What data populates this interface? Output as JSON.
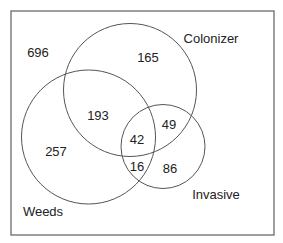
{
  "diagram": {
    "type": "venn",
    "sets": [
      {
        "id": "colonizer",
        "label": "Colonizer"
      },
      {
        "id": "weeds",
        "label": "Weeds"
      },
      {
        "id": "invasive",
        "label": "Invasive"
      }
    ],
    "regions": {
      "none": "696",
      "colonizer_only": "165",
      "weeds_and_colonizer": "193",
      "colonizer_and_invasive": "49",
      "all_three": "42",
      "weeds_only": "257",
      "weeds_and_invasive": "16",
      "invasive_only": "86"
    },
    "colors": {
      "stroke": "#555555",
      "frame": "#6b6b6b",
      "text": "#222222",
      "background": "#ffffff"
    }
  }
}
